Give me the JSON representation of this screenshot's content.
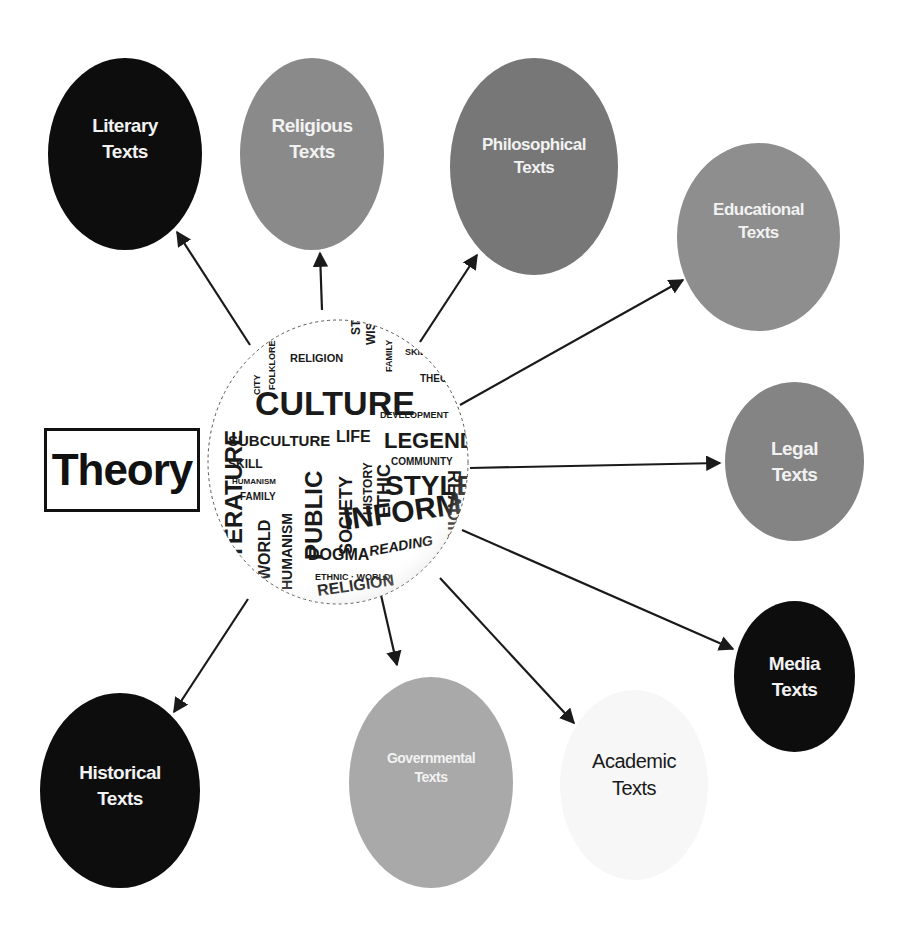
{
  "diagram": {
    "title": "Theory",
    "center": {
      "label": "Word cloud globe",
      "words": [
        "CULTURE",
        "SUBCULTURE",
        "LIFE",
        "LEGEND",
        "STYLE",
        "INFORMATION",
        "PUBLIC",
        "SOCIETY",
        "HISTORY",
        "ETHIC",
        "COMMUNITY",
        "DEVELOPMENT",
        "RELIGION",
        "DOGMA",
        "READING",
        "WORLD",
        "HUMANISM",
        "FAMILY",
        "SKILL",
        "LITERATURE",
        "BOOK",
        "WISDOM",
        "THEORY",
        "KNOWLEDGE",
        "ART",
        "ETHNIC",
        "CITY",
        "FOLKLORE"
      ]
    },
    "nodes": [
      {
        "id": "literary",
        "line1": "Literary",
        "line2": "Texts",
        "fill": "#0d0d0d",
        "text_color": "#f2f2f2"
      },
      {
        "id": "religious",
        "line1": "Religious",
        "line2": "Texts",
        "fill": "#8a8a8a",
        "text_color": "#f2f2f2"
      },
      {
        "id": "philosophical",
        "line1": "Philosophical",
        "line2": "Texts",
        "fill": "#777777",
        "text_color": "#f2f2f2"
      },
      {
        "id": "educational",
        "line1": "Educational",
        "line2": "Texts",
        "fill": "#8e8e8e",
        "text_color": "#f2f2f2"
      },
      {
        "id": "legal",
        "line1": "Legal",
        "line2": "Texts",
        "fill": "#848484",
        "text_color": "#f2f2f2"
      },
      {
        "id": "media",
        "line1": "Media",
        "line2": "Texts",
        "fill": "#0d0d0d",
        "text_color": "#f2f2f2"
      },
      {
        "id": "academic",
        "line1": "Academic",
        "line2": "Texts",
        "fill": "#f7f7f7",
        "text_color": "#1a1a1a"
      },
      {
        "id": "governmental",
        "line1": "Governmental",
        "line2": "Texts",
        "fill": "#a9a9a9",
        "text_color": "#f2f2f2"
      },
      {
        "id": "historical",
        "line1": "Historical",
        "line2": "Texts",
        "fill": "#0d0d0d",
        "text_color": "#f2f2f2"
      }
    ],
    "edges": [
      {
        "from": "center",
        "to": "literary"
      },
      {
        "from": "center",
        "to": "religious"
      },
      {
        "from": "center",
        "to": "philosophical"
      },
      {
        "from": "center",
        "to": "educational"
      },
      {
        "from": "center",
        "to": "legal"
      },
      {
        "from": "center",
        "to": "media"
      },
      {
        "from": "center",
        "to": "academic"
      },
      {
        "from": "center",
        "to": "governmental"
      },
      {
        "from": "center",
        "to": "historical"
      }
    ]
  }
}
